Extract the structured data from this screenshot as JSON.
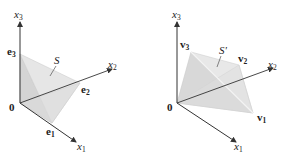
{
  "figure": {
    "left_panel": {
      "region_label": "S",
      "origin_label": "0",
      "axes": {
        "x1": {
          "label": "x",
          "subscript": "1"
        },
        "x2": {
          "label": "x",
          "subscript": "2"
        },
        "x3": {
          "label": "x",
          "subscript": "3"
        }
      },
      "vertices": {
        "v_a": {
          "label": "e",
          "subscript": "1"
        },
        "v_b": {
          "label": "e",
          "subscript": "2"
        },
        "v_c": {
          "label": "e",
          "subscript": "3"
        }
      }
    },
    "right_panel": {
      "region_label": "S'",
      "origin_label": "0",
      "axes": {
        "x1": {
          "label": "x",
          "subscript": "1"
        },
        "x2": {
          "label": "x",
          "subscript": "2"
        },
        "x3": {
          "label": "x",
          "subscript": "3"
        }
      },
      "vertices": {
        "v_a": {
          "label": "v",
          "subscript": "1"
        },
        "v_b": {
          "label": "v",
          "subscript": "2"
        },
        "v_c": {
          "label": "v",
          "subscript": "3"
        }
      }
    },
    "colors": {
      "axis": "#333333",
      "face_light": "#ececec",
      "face_mid": "#dedede",
      "face_dark": "#d2d2d2",
      "edge": "#c8c8c8"
    }
  }
}
